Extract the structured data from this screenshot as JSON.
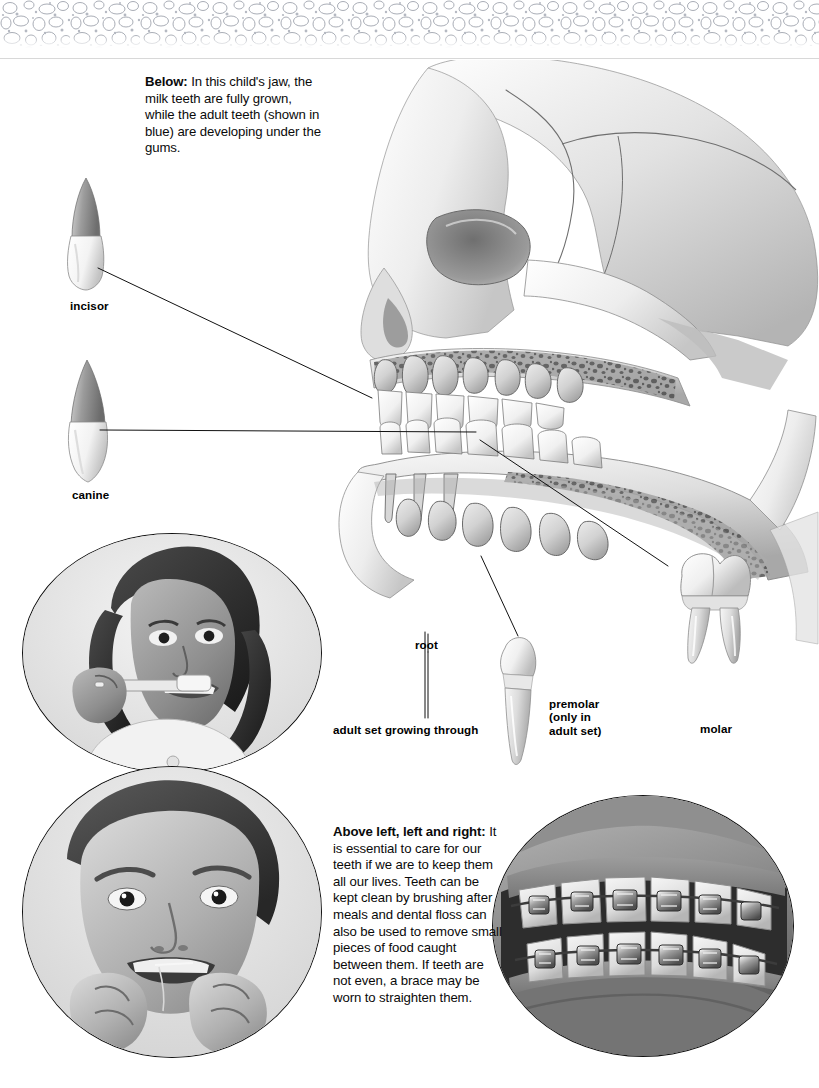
{
  "page": {
    "background": "#ffffff",
    "width": 819,
    "height": 1088,
    "decor": {
      "top_band_name": "pebble-texture-band",
      "band_color": "#b9bcc4"
    }
  },
  "captions": {
    "below_lead": "Below:",
    "below_text": " In this child's jaw, the milk teeth are fully grown, while the adult teeth (shown in blue) are developing under the gums.",
    "care_lead": "Above left, left and right:",
    "care_text": " It is essential to care for our teeth if we are to keep them all our lives. Teeth can be kept clean by brushing after meals and dental floss can also be used to remove small pieces of food caught between them. If teeth are not even, a brace may be worn to straighten them."
  },
  "labels": {
    "incisor": "incisor",
    "canine": "canine",
    "root": "root",
    "adult_growing": "adult set growing through",
    "premolar": "premolar\n(only in\nadult set)",
    "molar": "molar"
  },
  "figures": {
    "skull": "child-skull-jaw-cutaway-illustration",
    "incisor_tooth": "incisor-tooth-illustration",
    "canine_tooth": "canine-tooth-illustration",
    "premolar_tooth": "premolar-tooth-illustration",
    "molar_tooth": "molar-tooth-illustration"
  },
  "photos": {
    "brushing": "girl-brushing-teeth-photo",
    "flossing": "boy-flossing-teeth-photo",
    "braces": "teeth-with-braces-photo"
  },
  "colors": {
    "ink": "#000000",
    "bone_light": "#f2f2f2",
    "bone_mid": "#c9c9c9",
    "bone_dark": "#8d8d8d",
    "photo_gray": "#9a9a9a",
    "leader_line": "#111111"
  }
}
